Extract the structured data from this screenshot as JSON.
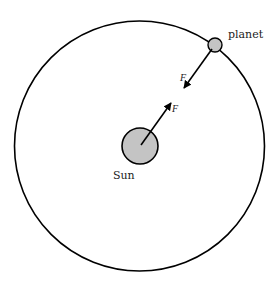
{
  "diagram": {
    "type": "orbit-force-diagram",
    "labels": {
      "planet": "planet",
      "sun": "Sun",
      "force_on_planet": "F",
      "force_on_sun": "F"
    },
    "colors": {
      "stroke": "#000000",
      "body_fill": "#c4c4c4",
      "text": "#222222",
      "background": "#ffffff"
    },
    "elements": {
      "orbit": {
        "cx": 139.5,
        "cy": 146,
        "r": 125
      },
      "sun": {
        "cx": 140,
        "cy": 146,
        "r": 18
      },
      "planet": {
        "cx": 215,
        "cy": 45,
        "r": 7
      },
      "arrow_on_planet": {
        "from": [
          212,
          49
        ],
        "to": [
          184,
          88
        ]
      },
      "arrow_on_sun": {
        "from": [
          141,
          145
        ],
        "to": [
          171,
          103
        ]
      }
    }
  }
}
